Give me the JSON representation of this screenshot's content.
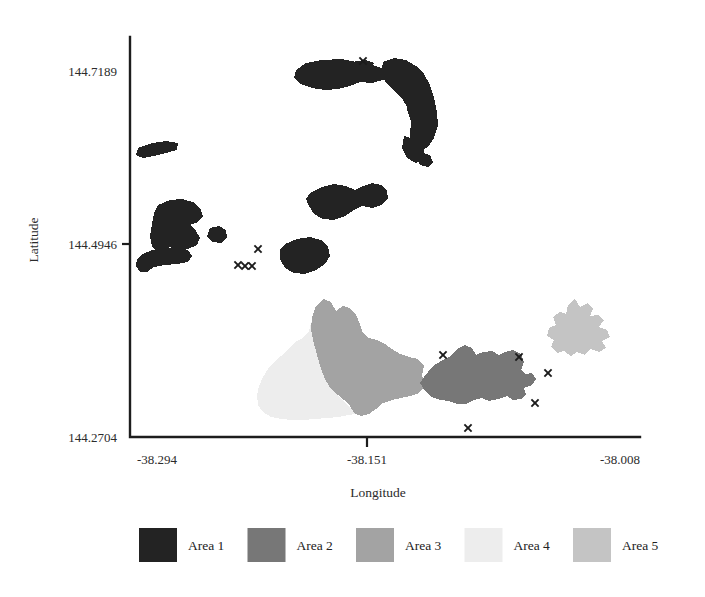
{
  "figure": {
    "background_color": "#ffffff",
    "axis_color": "#1d1d1d"
  },
  "axes": {
    "x_axis_title": "Longitude",
    "y_axis_title": "Latitude",
    "x_ticks": [
      "-38.294",
      "-38.151",
      "-38.008"
    ],
    "y_ticks": [
      "144.7189",
      "144.4946",
      "144.2704"
    ]
  },
  "legend": {
    "items": [
      {
        "label": "Area 1",
        "color": "#232323"
      },
      {
        "label": "Area 2",
        "color": "#777777"
      },
      {
        "label": "Area 3",
        "color": "#a3a3a3"
      },
      {
        "label": "Area 4",
        "color": "#ededed"
      },
      {
        "label": "Area 5",
        "color": "#c4c4c4"
      }
    ]
  },
  "chart_data": {
    "type": "map",
    "title": "",
    "xlabel": "Longitude",
    "ylabel": "Latitude",
    "xlim": [
      -38.294,
      -38.008
    ],
    "ylim": [
      144.2704,
      144.7189
    ],
    "xticks": [
      -38.294,
      -38.151,
      -38.008
    ],
    "yticks": [
      144.2704,
      144.4946,
      144.7189
    ],
    "grid": false,
    "legend_position": "bottom",
    "categories": [
      "Area 1",
      "Area 2",
      "Area 3",
      "Area 4",
      "Area 5"
    ],
    "colors": [
      "#232323",
      "#777777",
      "#a3a3a3",
      "#ededed",
      "#c4c4c4"
    ],
    "series": [
      {
        "name": "Area 1",
        "color": "#232323",
        "description": "Dark near-black patches in the upper half of the map: an elongated northern band, a curved arc descending to the right, a mid-central cluster, a small elongated western sliver, a blocky western cluster with satellite square, and a lower-central blob.",
        "polygons": [
          "296,70 306,63 322,60 341,59 356,62 370,64 381,68 389,74 383,80 372,83 360,82 350,86 338,89 325,90 312,88 301,84 294,78",
          "348,66 356,61 366,60 374,63 371,70 360,72 351,71",
          "383,62 394,58 406,60 416,66 424,74 430,85 434,98 437,112 438,126 434,138 428,147 419,151 412,145 410,134 412,122 409,110 403,100 395,92 387,84 381,74",
          "409,100 421,103 428,113 431,126 429,140 424,150 417,156 412,149 410,136 411,121 407,110",
          "404,136 417,140 424,150 424,160 416,163 407,158 402,148",
          "420,152 430,155 433,162 428,167 420,165 416,158",
          "138,148 152,143 166,141 178,143 177,150 166,153 154,156 143,158 136,155",
          "310,193 322,187 334,184 346,186 355,190 363,186 372,183 381,185 387,191 388,199 381,205 372,208 362,206 354,210 345,216 334,220 323,219 314,214 309,206 306,199",
          "158,205 170,200 182,199 193,202 200,208 203,216 198,222 190,225 196,231 200,238 197,245 188,249 178,250 170,247 164,251 157,252 152,246 150,236 152,224 154,213",
          "210,228 219,226 226,230 227,238 221,243 212,242 207,236",
          "141,255 152,250 165,248 178,248 188,250 192,256 188,262 177,264 165,265 154,267 147,272 140,272 136,266 137,259",
          "285,244 297,239 310,237 321,240 328,247 330,256 325,264 316,270 305,274 294,273 285,268 280,259 280,250"
        ],
        "markers": [
          {
            "x": 363,
            "y": 61
          },
          {
            "x": 258,
            "y": 249
          },
          {
            "x": 238,
            "y": 265
          },
          {
            "x": 245,
            "y": 266
          },
          {
            "x": 252,
            "y": 266
          }
        ]
      },
      {
        "name": "Area 2",
        "color": "#777777",
        "description": "Dark-grey eastern lobe of the main southern landmass, spanning the right-centre of the lower region.",
        "polygons": [
          "424,377 433,366 443,360 451,356 457,349 465,345 472,348 476,355 483,352 492,351 499,355 505,352 513,350 521,354 524,362 521,370 526,374 532,373 536,379 532,385 524,388 526,394 521,399 513,400 507,396 498,399 489,401 482,398 474,400 466,404 457,404 449,401 440,400 431,397 425,391 420,383"
        ],
        "markers": [
          {
            "x": 443,
            "y": 355
          },
          {
            "x": 519,
            "y": 357
          }
        ]
      },
      {
        "name": "Area 3",
        "color": "#a3a3a3",
        "description": "Medium-grey western lobe of the main southern landmass with a northward peninsula.",
        "polygons": [
          "316,306 324,299 331,302 336,311 343,306 350,308 356,315 360,324 363,333 369,338 377,340 385,344 392,349 400,354 409,357 418,359 424,366 422,375 425,386 419,393 410,396 401,398 392,400 383,403 376,409 369,414 361,416 354,413 350,406 344,400 338,395 331,389 326,381 322,372 319,362 316,351 313,340 311,329 312,317"
        ],
        "markers": []
      },
      {
        "name": "Area 4",
        "color": "#ededed",
        "description": "Very pale grey western flank of the southern landmass, broad and diffuse.",
        "polygons": [
          "312,320 309,331 303,338 295,342 288,349 281,356 274,362 268,369 263,377 259,386 257,395 258,405 263,412 271,417 281,419 292,420 303,420 315,419 327,418 338,417 348,415 356,414 350,408 343,401 336,394 330,387 325,378 321,368 318,357 315,345 313,333"
        ],
        "markers": []
      },
      {
        "name": "Area 5",
        "color": "#c4c4c4",
        "description": "Light-grey star/leaf-shaped isolated blob in the eastern part of the lower region.",
        "polygons": [
          "575,299 580,307 588,303 593,309 590,316 598,315 604,320 599,327 607,330 610,337 602,341 606,348 599,352 590,349 585,355 577,352 571,356 564,351 557,353 551,347 554,340 547,336 549,328 556,325 553,317 560,312 566,314 568,305"
        ],
        "markers": []
      }
    ],
    "scatter_markers": {
      "symbol": "x",
      "color": "#1b1b1b",
      "points": [
        {
          "x": 363,
          "y": 61
        },
        {
          "x": 258,
          "y": 249
        },
        {
          "x": 238,
          "y": 265
        },
        {
          "x": 245,
          "y": 266
        },
        {
          "x": 252,
          "y": 266
        },
        {
          "x": 443,
          "y": 355
        },
        {
          "x": 519,
          "y": 357
        },
        {
          "x": 548,
          "y": 373
        },
        {
          "x": 535,
          "y": 403
        },
        {
          "x": 468,
          "y": 428
        }
      ]
    }
  }
}
